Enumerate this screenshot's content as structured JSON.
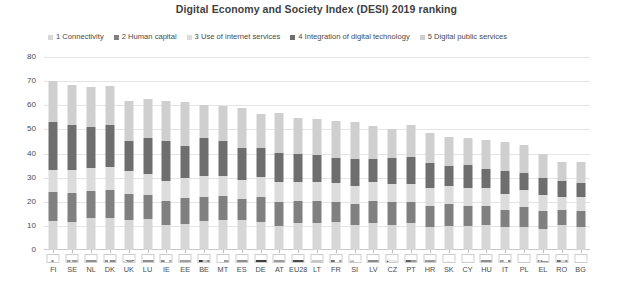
{
  "chart": {
    "title": "Digital Economy and Society Index (DESI) 2019 ranking"
  },
  "legend": {
    "items": [
      {
        "label": "1 Connectivity",
        "color": "#d7d7d7"
      },
      {
        "label": "2 Human capital",
        "color": "#808080"
      },
      {
        "label": "3 Use of internet services",
        "color": "#dcdcdc"
      },
      {
        "label": "4 Integration of digital technology",
        "color": "#6e6e6e"
      },
      {
        "label": "5 Digital public services",
        "color": "#cfcfcf"
      }
    ]
  },
  "chart_data": {
    "type": "bar",
    "subtype": "stacked-bar",
    "title": "Digital Economy and Society Index (DESI) 2019 ranking",
    "xlabel": "",
    "ylabel": "",
    "ylim": [
      0,
      80
    ],
    "ytick_labels": [
      "0",
      "10",
      "20",
      "30",
      "40",
      "50",
      "60",
      "70",
      "80"
    ],
    "ytick_values": [
      0,
      10,
      20,
      30,
      40,
      50,
      60,
      70,
      80
    ],
    "grid": true,
    "legend_position": "top",
    "categories": [
      "FI",
      "SE",
      "NL",
      "DK",
      "UK",
      "LU",
      "IE",
      "EE",
      "BE",
      "MT",
      "ES",
      "DE",
      "AT",
      "EU28",
      "LT",
      "FR",
      "SI",
      "LV",
      "CZ",
      "PT",
      "HR",
      "SK",
      "CY",
      "HU",
      "IT",
      "PL",
      "EL",
      "RO",
      "BG"
    ],
    "series": [
      {
        "name": "1 Connectivity",
        "color": "#d7d7d7",
        "values": [
          12.0,
          11.8,
          13.1,
          13.4,
          12.5,
          12.9,
          10.2,
          10.9,
          12.0,
          12.6,
          12.4,
          11.8,
          10.0,
          11.0,
          11.1,
          11.6,
          10.3,
          11.3,
          10.3,
          11.4,
          9.6,
          10.0,
          9.9,
          10.4,
          9.4,
          9.7,
          8.9,
          10.5,
          9.6
        ]
      },
      {
        "name": "2 Human capital",
        "color": "#808080",
        "values": [
          12.0,
          11.8,
          11.4,
          11.6,
          10.8,
          9.9,
          10.3,
          10.5,
          10.1,
          9.8,
          8.8,
          10.1,
          10.0,
          9.3,
          9.2,
          8.5,
          8.7,
          8.9,
          9.4,
          8.6,
          8.7,
          8.9,
          8.4,
          7.8,
          7.3,
          8.1,
          7.4,
          6.1,
          6.6
        ]
      },
      {
        "name": "3 Use of internet services",
        "color": "#dcdcdc",
        "values": [
          9.0,
          9.6,
          9.3,
          9.6,
          9.5,
          8.9,
          8.0,
          8.5,
          8.5,
          8.3,
          8.0,
          8.5,
          8.1,
          8.0,
          7.8,
          7.8,
          7.6,
          8.1,
          7.7,
          7.3,
          7.6,
          7.5,
          7.3,
          7.5,
          6.5,
          6.9,
          6.6,
          5.5,
          5.7
        ]
      },
      {
        "name": "4 Integration of digital technology",
        "color": "#6e6e6e",
        "values": [
          20.0,
          18.5,
          17.0,
          17.1,
          12.5,
          14.9,
          16.5,
          13.2,
          15.7,
          14.4,
          12.9,
          11.9,
          12.3,
          11.4,
          11.5,
          10.3,
          11.2,
          9.3,
          10.6,
          11.3,
          10.2,
          8.4,
          9.8,
          8.0,
          9.4,
          7.2,
          7.0,
          6.7,
          6.0
        ]
      },
      {
        "name": "5 Digital public services",
        "color": "#cfcfcf",
        "values": [
          16.9,
          16.8,
          16.7,
          16.3,
          16.3,
          16.1,
          16.7,
          18.4,
          13.9,
          14.8,
          16.6,
          14.0,
          16.2,
          14.9,
          14.8,
          15.2,
          15.3,
          14.0,
          12.3,
          13.4,
          12.4,
          12.1,
          11.2,
          11.8,
          12.1,
          11.6,
          10.0,
          7.7,
          8.4
        ]
      }
    ],
    "totals": [
      69.9,
      68.5,
      67.5,
      68.0,
      61.6,
      62.7,
      61.7,
      61.5,
      60.2,
      59.9,
      58.7,
      56.3,
      56.6,
      54.6,
      54.4,
      53.4,
      53.1,
      51.6,
      50.3,
      52.0,
      48.5,
      46.9,
      46.6,
      45.5,
      44.7,
      43.5,
      39.9,
      36.5,
      36.3
    ]
  },
  "xaxis": {
    "ticks": [
      {
        "code": "FI",
        "flag": "fi"
      },
      {
        "code": "SE",
        "flag": "se"
      },
      {
        "code": "NL",
        "flag": "nl"
      },
      {
        "code": "DK",
        "flag": "dk"
      },
      {
        "code": "UK",
        "flag": "uk"
      },
      {
        "code": "LU",
        "flag": "lu"
      },
      {
        "code": "IE",
        "flag": "ie"
      },
      {
        "code": "EE",
        "flag": "ee"
      },
      {
        "code": "BE",
        "flag": "be"
      },
      {
        "code": "MT",
        "flag": "mt"
      },
      {
        "code": "ES",
        "flag": "es"
      },
      {
        "code": "DE",
        "flag": "de"
      },
      {
        "code": "AT",
        "flag": "at"
      },
      {
        "code": "EU28",
        "flag": "eu"
      },
      {
        "code": "LT",
        "flag": "lt"
      },
      {
        "code": "FR",
        "flag": "fr"
      },
      {
        "code": "SI",
        "flag": "si"
      },
      {
        "code": "LV",
        "flag": "lv"
      },
      {
        "code": "CZ",
        "flag": "cz"
      },
      {
        "code": "PT",
        "flag": "pt"
      },
      {
        "code": "HR",
        "flag": "hr"
      },
      {
        "code": "SK",
        "flag": "sk"
      },
      {
        "code": "CY",
        "flag": "cy"
      },
      {
        "code": "HU",
        "flag": "hu"
      },
      {
        "code": "IT",
        "flag": "it"
      },
      {
        "code": "PL",
        "flag": "pl"
      },
      {
        "code": "EL",
        "flag": "el"
      },
      {
        "code": "RO",
        "flag": "ro"
      },
      {
        "code": "BG",
        "flag": "bg"
      }
    ]
  }
}
